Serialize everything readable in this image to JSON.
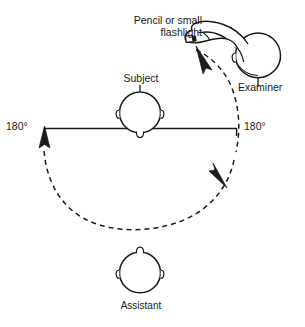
{
  "figure": {
    "labels": {
      "tool": "Pencil or small\nflashlight",
      "subject": "Subject",
      "examiner": "Examiner",
      "assistant": "Assistant",
      "degree_left": "180°",
      "degree_right": "180°"
    },
    "colors": {
      "ink": "#1a1a1a",
      "background": "#ffffff",
      "dash": "#1a1a1a"
    },
    "elements": {
      "subject_head": "top-down head, nose pointing down toward assistant",
      "examiner_head": "top-down head at upper right",
      "assistant_head": "top-down head, nose pointing up toward subject",
      "examiner_arm": "outlined arm and hand holding pencil or small flashlight",
      "horizontal_axis": "straight line through subject head spanning the two 180° marks",
      "dashed_arc": "dashed arc sweeping from the pencil tip clockwise down and around to the left 180° mark",
      "arrowheads": [
        "arrowhead below pencil tip pointing down-right",
        "arrowhead on right side of arc pointing down-left",
        "arrowhead at left end of arc pointing up"
      ]
    }
  }
}
